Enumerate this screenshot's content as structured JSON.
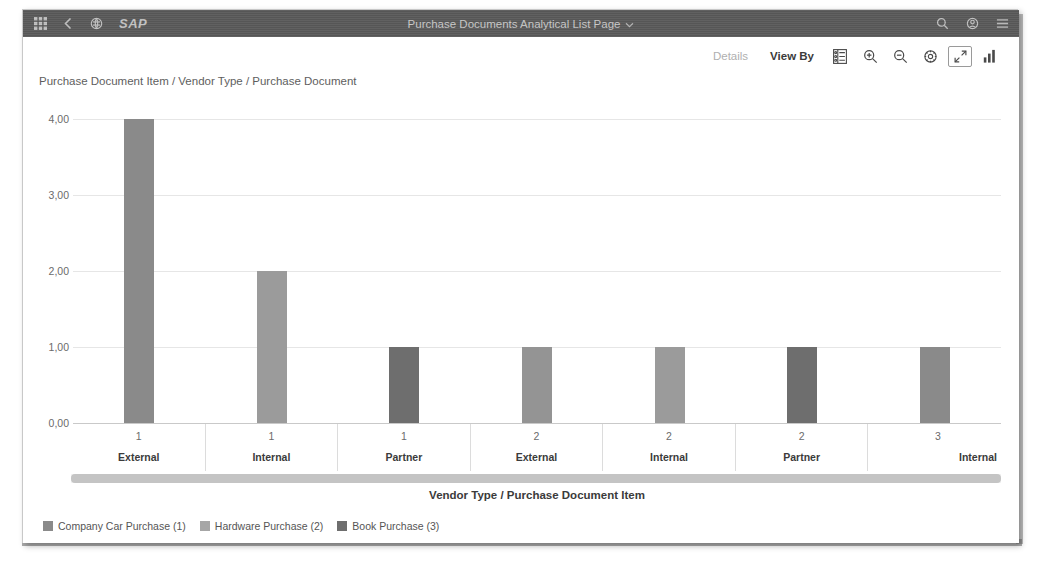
{
  "shellbar": {
    "title": "Purchase Documents Analytical List Page",
    "logo": "SAP",
    "left_icons": [
      "grid-menu-icon",
      "back-chevron-icon",
      "home-icon"
    ],
    "right_icons": [
      "search-icon",
      "user-settings-icon",
      "overflow-menu-icon"
    ],
    "background": "#5a5a5a"
  },
  "toolbar": {
    "details_label": "Details",
    "view_by_label": "View By",
    "buttons": [
      {
        "name": "legend-toggle-icon"
      },
      {
        "name": "zoom-in-icon"
      },
      {
        "name": "zoom-out-icon"
      },
      {
        "name": "settings-gear-icon"
      },
      {
        "name": "fullscreen-icon",
        "active": true
      },
      {
        "name": "chart-type-icon"
      }
    ]
  },
  "chart_data": {
    "type": "bar",
    "title": "Purchase Document Item / Vendor Type / Purchase Document",
    "xlabel": "Vendor Type / Purchase Document Item",
    "ylabel": "",
    "ylim": [
      0,
      4
    ],
    "grid": true,
    "legend_position": "bottom-left",
    "ytick_labels": [
      "0,00",
      "1,00",
      "2,00",
      "3,00",
      "4,00"
    ],
    "ytick_values": [
      0,
      1,
      2,
      3,
      4
    ],
    "categories": [
      {
        "num": "1",
        "label": "External"
      },
      {
        "num": "1",
        "label": "Internal"
      },
      {
        "num": "1",
        "label": "Partner"
      },
      {
        "num": "2",
        "label": "External"
      },
      {
        "num": "2",
        "label": "Internal"
      },
      {
        "num": "2",
        "label": "Partner"
      },
      {
        "num": "3",
        "label": "Internal"
      }
    ],
    "values": [
      4,
      2,
      1,
      1,
      1,
      1,
      1
    ],
    "bar_colors": [
      "#8a8a8a",
      "#9b9b9b",
      "#6e6e6e",
      "#949494",
      "#9b9b9b",
      "#6e6e6e",
      "#8a8a8a"
    ],
    "legend": [
      {
        "label": "Company Car Purchase (1)",
        "color": "#8a8a8a"
      },
      {
        "label": "Hardware Purchase (2)",
        "color": "#a6a6a6"
      },
      {
        "label": "Book Purchase (3)",
        "color": "#6e6e6e"
      }
    ]
  },
  "scrollbar": {
    "orientation": "horizontal",
    "thumb_color": "#c4c4c4"
  }
}
